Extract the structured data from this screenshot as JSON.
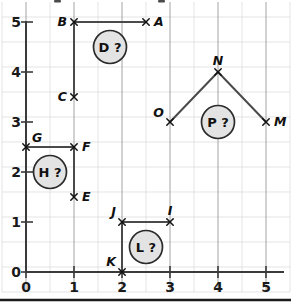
{
  "figure": {
    "title": ""
  },
  "chart_data": {
    "type": "scatter",
    "title": "",
    "xlabel": "",
    "ylabel": "",
    "xlim": [
      0,
      5
    ],
    "ylim": [
      0,
      5
    ],
    "grid": true,
    "grid_minor_step": 0.5,
    "grid_major_step": 1,
    "legend": "none",
    "xticks": [
      "0",
      "1",
      "2",
      "3",
      "4",
      "5"
    ],
    "yticks": [
      "0",
      "1",
      "2",
      "3",
      "4",
      "5"
    ],
    "points": [
      {
        "label": "A",
        "x": 2.5,
        "y": 5.0,
        "label_pos": "right"
      },
      {
        "label": "B",
        "x": 1.0,
        "y": 5.0,
        "label_pos": "left"
      },
      {
        "label": "C",
        "x": 1.0,
        "y": 3.5,
        "label_pos": "left"
      },
      {
        "label": "E",
        "x": 1.0,
        "y": 1.5,
        "label_pos": "right"
      },
      {
        "label": "F",
        "x": 1.0,
        "y": 2.5,
        "label_pos": "right"
      },
      {
        "label": "G",
        "x": 0.0,
        "y": 2.5,
        "label_pos": "upper-right"
      },
      {
        "label": "I",
        "x": 3.0,
        "y": 1.0,
        "label_pos": "above"
      },
      {
        "label": "J",
        "x": 2.0,
        "y": 1.0,
        "label_pos": "above-left"
      },
      {
        "label": "K",
        "x": 2.0,
        "y": 0.0,
        "label_pos": "above-left"
      },
      {
        "label": "M",
        "x": 5.0,
        "y": 3.0,
        "label_pos": "right"
      },
      {
        "label": "N",
        "x": 4.0,
        "y": 4.0,
        "label_pos": "above"
      },
      {
        "label": "O",
        "x": 3.0,
        "y": 3.0,
        "label_pos": "upper-left"
      }
    ],
    "segments": [
      {
        "name": "B-A",
        "from": "B",
        "to": "A",
        "x1": 1.0,
        "y1": 5.0,
        "x2": 2.5,
        "y2": 5.0
      },
      {
        "name": "B-C",
        "from": "B",
        "to": "C",
        "x1": 1.0,
        "y1": 5.0,
        "x2": 1.0,
        "y2": 3.5
      },
      {
        "name": "G-F",
        "from": "G",
        "to": "F",
        "x1": 0.0,
        "y1": 2.5,
        "x2": 1.0,
        "y2": 2.5
      },
      {
        "name": "F-E",
        "from": "F",
        "to": "E",
        "x1": 1.0,
        "y1": 2.5,
        "x2": 1.0,
        "y2": 1.5
      },
      {
        "name": "J-I",
        "from": "J",
        "to": "I",
        "x1": 2.0,
        "y1": 1.0,
        "x2": 3.0,
        "y2": 1.0
      },
      {
        "name": "J-K",
        "from": "J",
        "to": "K",
        "x1": 2.0,
        "y1": 1.0,
        "x2": 2.0,
        "y2": 0.0
      },
      {
        "name": "O-N",
        "from": "O",
        "to": "N",
        "x1": 3.0,
        "y1": 3.0,
        "x2": 4.0,
        "y2": 4.0
      },
      {
        "name": "N-M",
        "from": "N",
        "to": "M",
        "x1": 4.0,
        "y1": 4.0,
        "x2": 5.0,
        "y2": 3.0
      }
    ],
    "annotations": [
      {
        "label": "D ?",
        "letter": "D",
        "x": 1.75,
        "y": 4.5
      },
      {
        "label": "H ?",
        "letter": "H",
        "x": 0.5,
        "y": 2.0
      },
      {
        "label": "L ?",
        "letter": "L",
        "x": 2.5,
        "y": 0.5
      },
      {
        "label": "P ?",
        "letter": "P",
        "x": 4.0,
        "y": 3.0
      }
    ]
  },
  "axes": {
    "x": {
      "tick_0": "0",
      "tick_1": "1",
      "tick_2": "2",
      "tick_3": "3",
      "tick_4": "4",
      "tick_5": "5"
    },
    "y": {
      "tick_0": "0",
      "tick_1": "1",
      "tick_2": "2",
      "tick_3": "3",
      "tick_4": "4",
      "tick_5": "5"
    }
  },
  "labels": {
    "A": "A",
    "B": "B",
    "C": "C",
    "E": "E",
    "F": "F",
    "G": "G",
    "I": "I",
    "J": "J",
    "K": "K",
    "M": "M",
    "N": "N",
    "O": "O",
    "D_bubble": "D ?",
    "H_bubble": "H ?",
    "L_bubble": "L ?",
    "P_bubble": "P ?"
  },
  "colors": {
    "grid_minor": "#d8d8d8",
    "grid_major": "#9a9a9a",
    "axis": "#3a3a3a",
    "segment": "#4a4a4a",
    "marker": "#111111",
    "bubble_fill": "#e3e3e3",
    "bubble_stroke": "#2b2b2b",
    "background": "#ffffff"
  }
}
